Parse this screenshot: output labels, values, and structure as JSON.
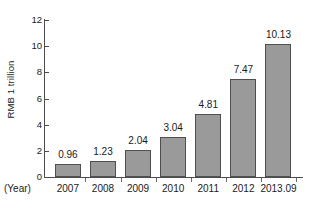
{
  "chart_data": {
    "type": "bar",
    "title": "",
    "subtitle": "",
    "xlabel": "(Year)",
    "ylabel": "RMB 1 trillion",
    "categories": [
      "2007",
      "2008",
      "2009",
      "2010",
      "2011",
      "2012",
      "2013.09"
    ],
    "values": [
      0.96,
      1.23,
      2.04,
      3.04,
      4.81,
      7.47,
      10.13
    ],
    "value_labels": [
      "0.96",
      "1.23",
      "2.04",
      "3.04",
      "4.81",
      "7.47",
      "10.13"
    ],
    "ylim": [
      0,
      12
    ],
    "ytick_labels": [
      "0",
      "2",
      "4",
      "6",
      "8",
      "10",
      "12"
    ],
    "ytick_values": [
      0,
      2,
      4,
      6,
      8,
      10,
      12
    ],
    "grid": false,
    "legend": null,
    "legend_position": "none",
    "series": [
      {
        "name": "RMB 1 trillion",
        "values": [
          0.96,
          1.23,
          2.04,
          3.04,
          4.81,
          7.47,
          10.13
        ]
      }
    ],
    "colors": {
      "bar_fill": "#9a9a9a",
      "bar_border": "#4f4f4f",
      "axis": "#4d4d4d",
      "text": "#1a1a1a",
      "background": "#ffffff"
    }
  }
}
